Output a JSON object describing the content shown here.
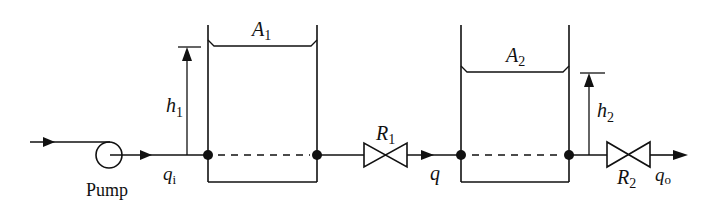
{
  "diagram": {
    "type": "two-tank liquid-level system",
    "colors": {
      "line": "#111111",
      "background": "#ffffff"
    },
    "pump": {
      "label": "Pump"
    },
    "flows": {
      "inlet": {
        "symbol": "q",
        "subscript": "i"
      },
      "intermediate": {
        "symbol": "q"
      },
      "outlet": {
        "symbol": "q",
        "subscript": "o"
      }
    },
    "tank1": {
      "area": {
        "symbol": "A",
        "subscript": "1"
      },
      "level": {
        "symbol": "h",
        "subscript": "1"
      }
    },
    "tank2": {
      "area": {
        "symbol": "A",
        "subscript": "2"
      },
      "level": {
        "symbol": "h",
        "subscript": "2"
      }
    },
    "valve1": {
      "resistance": {
        "symbol": "R",
        "subscript": "1"
      }
    },
    "valve2": {
      "resistance": {
        "symbol": "R",
        "subscript": "2"
      }
    }
  }
}
